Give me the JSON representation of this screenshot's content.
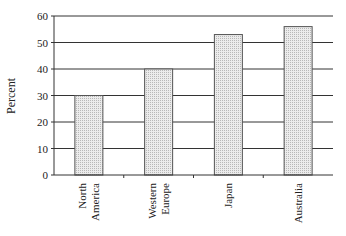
{
  "chart_data": {
    "type": "bar",
    "title": "",
    "xlabel": "",
    "ylabel": "Percent",
    "categories": [
      "North America",
      "Western Europe",
      "Japan",
      "Australia"
    ],
    "category_lines": [
      [
        "North",
        "America"
      ],
      [
        "Western",
        "Europe"
      ],
      [
        "Japan"
      ],
      [
        "Australia"
      ]
    ],
    "values": [
      30,
      40,
      53,
      56
    ],
    "ylim": [
      0,
      60
    ],
    "yticks": [
      0,
      10,
      20,
      30,
      40,
      50,
      60
    ],
    "grid": true,
    "legend": null,
    "bar_fill": "#d9d9d9",
    "bar_stroke": "#555555",
    "grid_color": "#333333"
  }
}
